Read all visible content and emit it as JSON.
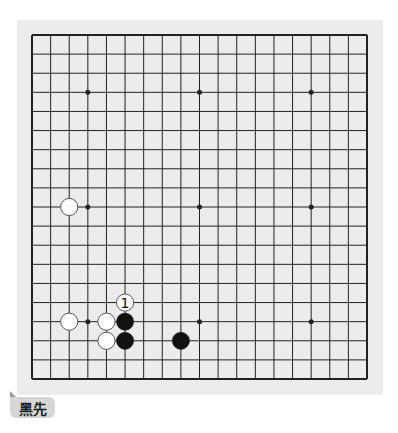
{
  "board": {
    "size": 19,
    "colors": {
      "background": "#ececec",
      "line": "#222222",
      "black_stone": "#111111",
      "white_stone": "#ffffff",
      "white_stroke": "#555555"
    },
    "star_points": [
      [
        3,
        3
      ],
      [
        9,
        3
      ],
      [
        15,
        3
      ],
      [
        3,
        9
      ],
      [
        9,
        9
      ],
      [
        15,
        9
      ],
      [
        3,
        15
      ],
      [
        9,
        15
      ],
      [
        15,
        15
      ]
    ],
    "stones": [
      {
        "col": 2,
        "row": 9,
        "color": "white"
      },
      {
        "col": 2,
        "row": 15,
        "color": "white"
      },
      {
        "col": 4,
        "row": 15,
        "color": "white"
      },
      {
        "col": 5,
        "row": 15,
        "color": "black"
      },
      {
        "col": 4,
        "row": 16,
        "color": "white"
      },
      {
        "col": 5,
        "row": 16,
        "color": "black"
      },
      {
        "col": 8,
        "row": 16,
        "color": "black"
      }
    ],
    "move_markers": [
      {
        "col": 5,
        "row": 14,
        "color": "white",
        "label": "1"
      }
    ]
  },
  "footer": {
    "to_play_label": "黑先"
  }
}
